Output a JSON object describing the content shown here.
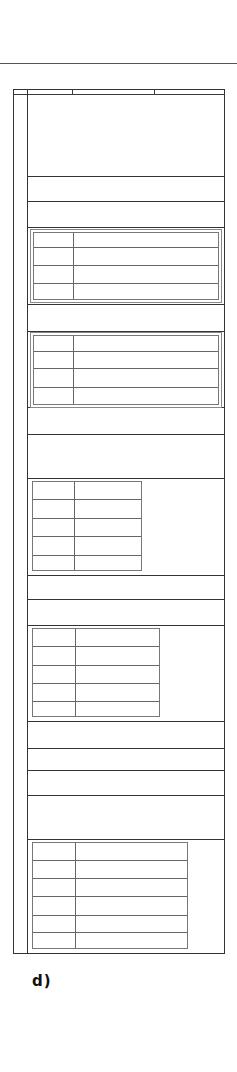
{
  "figure": {
    "caption": "d)",
    "line_color": "#333333",
    "background": "#ffffff"
  },
  "header_row": {
    "column_dividers_x": [
      27,
      72,
      154
    ],
    "top": 89,
    "bottom": 94
  },
  "section_lines_y": [
    94,
    176,
    201,
    227,
    304,
    331,
    407,
    434,
    478,
    575,
    599,
    625,
    721,
    748,
    770,
    795,
    839
  ],
  "tables": [
    {
      "id": "table-1",
      "left": 32,
      "top": 231,
      "right": 220,
      "bottom": 300,
      "rows": 4,
      "col_divider_x": 72,
      "double_border": true
    },
    {
      "id": "table-2",
      "left": 32,
      "top": 334,
      "right": 220,
      "bottom": 405,
      "rows": 4,
      "col_divider_x": 72,
      "double_border": true
    },
    {
      "id": "table-3",
      "left": 32,
      "top": 481,
      "right": 141,
      "bottom": 571,
      "rows": 5,
      "col_divider_x": 73,
      "double_border": false
    },
    {
      "id": "table-4",
      "left": 32,
      "top": 628,
      "right": 159,
      "bottom": 717,
      "rows": 5,
      "col_divider_x": 74,
      "double_border": false
    },
    {
      "id": "table-5",
      "left": 32,
      "top": 842,
      "right": 187,
      "bottom": 949,
      "rows": 6,
      "col_divider_x": 74,
      "double_border": false
    }
  ]
}
